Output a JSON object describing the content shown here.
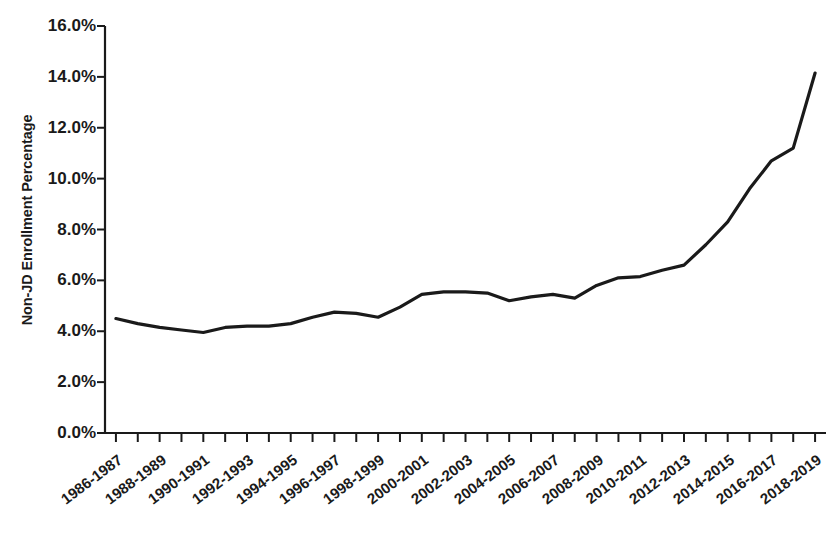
{
  "chart_data": {
    "type": "line",
    "title": "",
    "xlabel": "",
    "ylabel": "Non-JD Enrollment Percentage",
    "ylim": [
      0,
      16
    ],
    "ytick_labels": [
      "16.0%",
      "14.0%",
      "12.0%",
      "10.0%",
      "8.0%",
      "6.0%",
      "4.0%",
      "2.0%",
      "0.0%"
    ],
    "ytick_values": [
      16,
      14,
      12,
      10,
      8,
      6,
      4,
      2,
      0
    ],
    "grid": false,
    "legend": "none",
    "x": [
      "1986-1987",
      "1987-1988",
      "1988-1989",
      "1989-1990",
      "1990-1991",
      "1991-1992",
      "1992-1993",
      "1993-1994",
      "1994-1995",
      "1995-1996",
      "1996-1997",
      "1997-1998",
      "1998-1999",
      "1999-2000",
      "2000-2001",
      "2001-2002",
      "2002-2003",
      "2003-2004",
      "2004-2005",
      "2005-2006",
      "2006-2007",
      "2007-2008",
      "2008-2009",
      "2009-2010",
      "2010-2011",
      "2011-2012",
      "2012-2013",
      "2013-2014",
      "2014-2015",
      "2015-2016",
      "2016-2017",
      "2017-2018",
      "2018-2019"
    ],
    "xtick_labels": [
      "1986-1987",
      "1988-1989",
      "1990-1991",
      "1992-1993",
      "1994-1995",
      "1996-1997",
      "1998-1999",
      "2000-2001",
      "2002-2003",
      "2004-2005",
      "2006-2007",
      "2008-2009",
      "2010-2011",
      "2012-2013",
      "2014-2015",
      "2016-2017",
      "2018-2019"
    ],
    "values": [
      4.5,
      4.3,
      4.15,
      4.05,
      3.95,
      4.15,
      4.2,
      4.2,
      4.3,
      4.55,
      4.75,
      4.7,
      4.55,
      4.95,
      5.45,
      5.55,
      5.55,
      5.5,
      5.2,
      5.35,
      5.45,
      5.3,
      5.8,
      6.1,
      6.15,
      6.4,
      6.6,
      7.4,
      8.3,
      9.6,
      10.7,
      11.2,
      14.15
    ],
    "series_name": "Non-JD Enrollment Percentage",
    "line_color": "#1a1a1a",
    "line_width": 3.2
  }
}
